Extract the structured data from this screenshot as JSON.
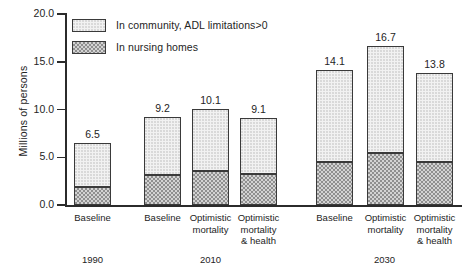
{
  "chart_data": {
    "type": "bar",
    "subtype": "stacked-bar",
    "title": "",
    "xlabel": "",
    "ylabel": "Millions of persons",
    "ylim": [
      0.0,
      20.0
    ],
    "yticks": [
      "0.0",
      "5.0",
      "10.0",
      "15.0",
      "20.0"
    ],
    "ytick_values": [
      0.0,
      5.0,
      10.0,
      15.0,
      20.0
    ],
    "grid": false,
    "legend_position": "top-left inside plot",
    "categories": [
      "Baseline",
      "Baseline",
      "Optimistic\nmortality",
      "Optimistic\nmortality\n& health",
      "Baseline",
      "Optimistic\nmortality",
      "Optimistic\nmortality\n& health"
    ],
    "groups": [
      {
        "label": "1990",
        "bar_indices": [
          0
        ]
      },
      {
        "label": "2010",
        "bar_indices": [
          1,
          2,
          3
        ]
      },
      {
        "label": "2030",
        "bar_indices": [
          4,
          5,
          6
        ]
      }
    ],
    "series": [
      {
        "name": "In nursing homes",
        "values": [
          1.9,
          3.1,
          3.6,
          3.2,
          4.5,
          5.4,
          4.5
        ]
      },
      {
        "name": "In community, ADL limitations>0",
        "values": [
          4.6,
          6.1,
          6.5,
          5.9,
          9.6,
          11.3,
          9.3
        ]
      }
    ],
    "totals": [
      6.5,
      9.2,
      10.1,
      9.1,
      14.1,
      16.7,
      13.8
    ],
    "total_labels": [
      "6.5",
      "9.2",
      "10.1",
      "9.1",
      "14.1",
      "16.7",
      "13.8"
    ]
  },
  "legend": {
    "items": [
      {
        "label": "In community, ADL limitations>0",
        "swatch": "light-dotted"
      },
      {
        "label": "In nursing homes",
        "swatch": "dark-checkered"
      }
    ]
  },
  "colors": {
    "community_fill": "#f2f2f2",
    "nursing_fill": "#b8b8b8",
    "outline": "#3a3a3a",
    "axis": "#2b2b2b",
    "text": "#242424",
    "background": "#ffffff"
  }
}
